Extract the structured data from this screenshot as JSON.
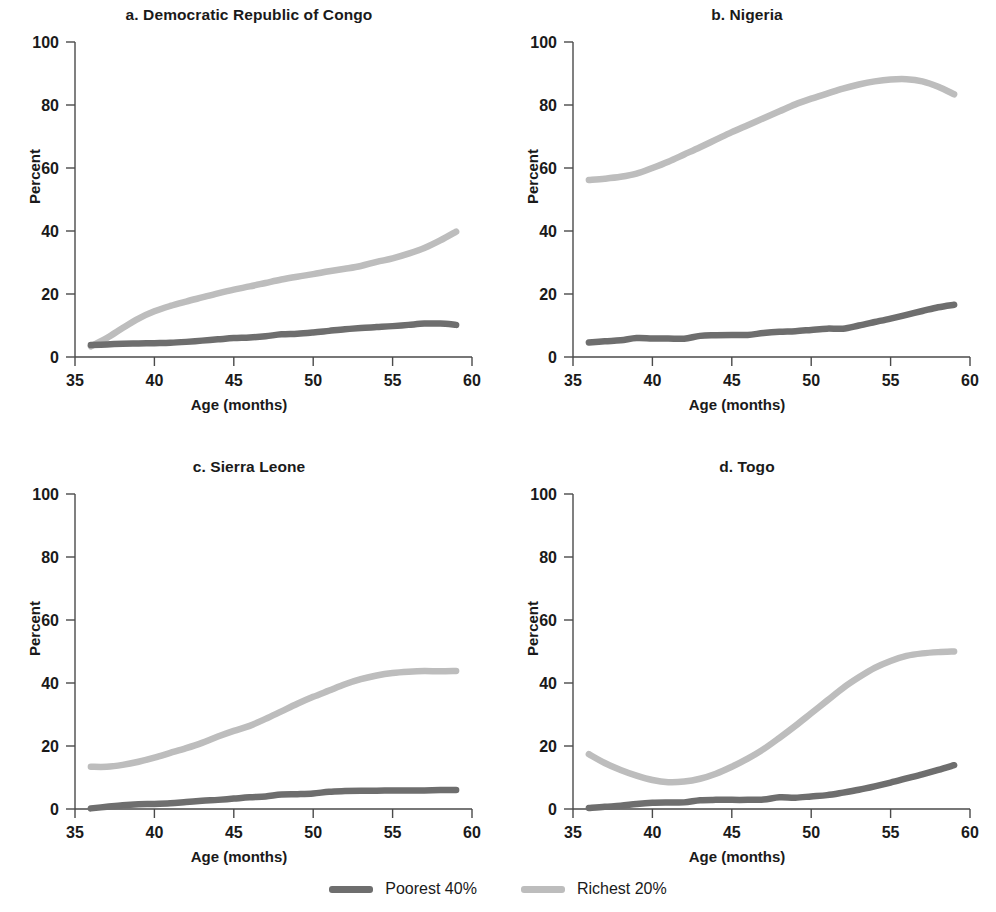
{
  "figure": {
    "axis_label_x": "Age (months)",
    "axis_label_y": "Percent",
    "xticks": [
      "35",
      "40",
      "45",
      "50",
      "55",
      "60"
    ],
    "yticks": [
      "0",
      "20",
      "40",
      "60",
      "80",
      "100"
    ]
  },
  "legend": {
    "items": [
      {
        "label": "Poorest 40%",
        "color": "#6e6e6e"
      },
      {
        "label": "Richest 20%",
        "color": "#bdbdbd"
      }
    ]
  },
  "colors": {
    "poorest": "#6e6e6e",
    "richest": "#bdbdbd",
    "axis": "#4a4a4a",
    "text": "#1a1a1a"
  },
  "panels": [
    {
      "key": "a",
      "title": "a.  Democratic Republic of Congo"
    },
    {
      "key": "b",
      "title": "b.  Nigeria"
    },
    {
      "key": "c",
      "title": "c.  Sierra Leone"
    },
    {
      "key": "d",
      "title": "d.  Togo"
    }
  ],
  "chart_data": [
    {
      "type": "line",
      "title": "a.  Democratic Republic of Congo",
      "xlabel": "Age (months)",
      "ylabel": "Percent",
      "xlim": [
        35,
        60
      ],
      "ylim": [
        0,
        100
      ],
      "xticks": [
        35,
        40,
        45,
        50,
        55,
        60
      ],
      "yticks": [
        0,
        20,
        40,
        60,
        80,
        100
      ],
      "grid": false,
      "legend_position": "bottom-center-shared",
      "x": [
        36,
        37,
        38,
        39,
        40,
        41,
        42,
        43,
        44,
        45,
        46,
        47,
        48,
        49,
        50,
        51,
        52,
        53,
        54,
        55,
        56,
        57,
        58,
        59
      ],
      "series": [
        {
          "name": "Poorest 40%",
          "color": "#6e6e6e",
          "values": [
            3.8,
            4.0,
            4.2,
            4.3,
            4.4,
            4.5,
            4.8,
            5.2,
            5.6,
            6.0,
            6.2,
            6.6,
            7.2,
            7.4,
            7.8,
            8.3,
            8.8,
            9.2,
            9.5,
            9.8,
            10.2,
            10.6,
            10.6,
            10.2
          ]
        },
        {
          "name": "Richest 20%",
          "color": "#bdbdbd",
          "values": [
            3.4,
            6.0,
            9.2,
            12.2,
            14.5,
            16.2,
            17.6,
            18.9,
            20.2,
            21.4,
            22.4,
            23.5,
            24.6,
            25.5,
            26.3,
            27.2,
            28.0,
            28.9,
            30.2,
            31.3,
            32.8,
            34.6,
            37.0,
            39.8
          ]
        }
      ]
    },
    {
      "type": "line",
      "title": "b.  Nigeria",
      "xlabel": "Age (months)",
      "ylabel": "Percent",
      "xlim": [
        35,
        60
      ],
      "ylim": [
        0,
        100
      ],
      "xticks": [
        35,
        40,
        45,
        50,
        55,
        60
      ],
      "yticks": [
        0,
        20,
        40,
        60,
        80,
        100
      ],
      "grid": false,
      "legend_position": "bottom-center-shared",
      "x": [
        36,
        37,
        38,
        39,
        40,
        41,
        42,
        43,
        44,
        45,
        46,
        47,
        48,
        49,
        50,
        51,
        52,
        53,
        54,
        55,
        56,
        57,
        58,
        59
      ],
      "series": [
        {
          "name": "Poorest 40%",
          "color": "#6e6e6e",
          "values": [
            4.6,
            5.0,
            5.3,
            6.0,
            5.9,
            5.9,
            5.8,
            6.7,
            6.9,
            7.0,
            7.0,
            7.6,
            8.0,
            8.2,
            8.6,
            9.0,
            9.0,
            10.0,
            11.1,
            12.2,
            13.4,
            14.6,
            15.8,
            16.6
          ]
        },
        {
          "name": "Richest 20%",
          "color": "#bdbdbd",
          "values": [
            56.2,
            56.6,
            57.2,
            58.2,
            60.0,
            62.0,
            64.3,
            66.6,
            69.0,
            71.4,
            73.6,
            75.8,
            78.0,
            80.2,
            82.0,
            83.6,
            85.2,
            86.5,
            87.5,
            88.1,
            88.2,
            87.5,
            85.8,
            83.4
          ]
        }
      ]
    },
    {
      "type": "line",
      "title": "c.  Sierra Leone",
      "xlabel": "Age (months)",
      "ylabel": "Percent",
      "xlim": [
        35,
        60
      ],
      "ylim": [
        0,
        100
      ],
      "xticks": [
        35,
        40,
        45,
        50,
        55,
        60
      ],
      "yticks": [
        0,
        20,
        40,
        60,
        80,
        100
      ],
      "grid": false,
      "legend_position": "bottom-center-shared",
      "x": [
        36,
        37,
        38,
        39,
        40,
        41,
        42,
        43,
        44,
        45,
        46,
        47,
        48,
        49,
        50,
        51,
        52,
        53,
        54,
        55,
        56,
        57,
        58,
        59
      ],
      "series": [
        {
          "name": "Poorest 40%",
          "color": "#6e6e6e",
          "values": [
            0.2,
            0.7,
            1.2,
            1.5,
            1.6,
            1.8,
            2.2,
            2.6,
            2.9,
            3.3,
            3.7,
            4.0,
            4.6,
            4.7,
            4.9,
            5.5,
            5.7,
            5.8,
            5.8,
            5.9,
            5.9,
            5.9,
            6.0,
            6.0
          ]
        },
        {
          "name": "Richest 20%",
          "color": "#bdbdbd",
          "values": [
            13.4,
            13.4,
            14.0,
            15.0,
            16.3,
            17.8,
            19.3,
            21.0,
            23.0,
            24.8,
            26.4,
            28.6,
            31.0,
            33.4,
            35.6,
            37.6,
            39.6,
            41.2,
            42.4,
            43.2,
            43.6,
            43.8,
            43.7,
            43.8
          ]
        }
      ]
    },
    {
      "type": "line",
      "title": "d.  Togo",
      "xlabel": "Age (months)",
      "ylabel": "Percent",
      "xlim": [
        35,
        60
      ],
      "ylim": [
        0,
        100
      ],
      "xticks": [
        35,
        40,
        45,
        50,
        55,
        60
      ],
      "yticks": [
        0,
        20,
        40,
        60,
        80,
        100
      ],
      "grid": false,
      "legend_position": "bottom-center-shared",
      "x": [
        36,
        37,
        38,
        39,
        40,
        41,
        42,
        43,
        44,
        45,
        46,
        47,
        48,
        49,
        50,
        51,
        52,
        53,
        54,
        55,
        56,
        57,
        58,
        59
      ],
      "series": [
        {
          "name": "Poorest 40%",
          "color": "#6e6e6e",
          "values": [
            0.3,
            0.7,
            1.0,
            1.6,
            2.0,
            2.1,
            2.1,
            2.8,
            2.9,
            2.9,
            2.9,
            3.0,
            3.7,
            3.6,
            4.0,
            4.4,
            5.2,
            6.1,
            7.2,
            8.4,
            9.7,
            11.0,
            12.4,
            13.9
          ]
        },
        {
          "name": "Richest 20%",
          "color": "#bdbdbd",
          "values": [
            17.4,
            14.6,
            12.4,
            10.6,
            9.2,
            8.5,
            8.7,
            9.6,
            11.2,
            13.4,
            16.0,
            19.0,
            22.6,
            26.4,
            30.4,
            34.4,
            38.4,
            41.8,
            44.8,
            47.0,
            48.6,
            49.4,
            49.8,
            50.0
          ]
        }
      ]
    }
  ]
}
